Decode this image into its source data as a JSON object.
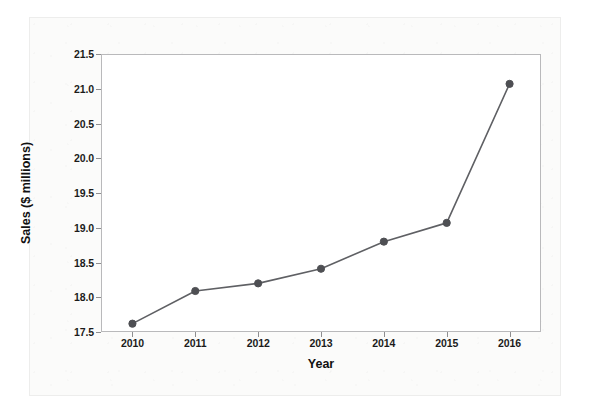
{
  "chart_data": {
    "type": "line",
    "title": "",
    "xlabel": "Year",
    "ylabel": "Sales ($ millions)",
    "categories": [
      "2010",
      "2011",
      "2012",
      "2013",
      "2014",
      "2015",
      "2016"
    ],
    "values": [
      17.62,
      18.09,
      18.2,
      18.41,
      18.8,
      19.07,
      21.07
    ],
    "series": [
      {
        "name": "Sales",
        "values": [
          17.62,
          18.09,
          18.2,
          18.41,
          18.8,
          19.07,
          21.07
        ]
      }
    ],
    "ylim": [
      17.5,
      21.5
    ],
    "y_ticks": [
      "17.5",
      "18.0",
      "18.5",
      "19.0",
      "19.5",
      "20.0",
      "20.5",
      "21.0",
      "21.5"
    ],
    "y_tick_values": [
      17.5,
      18.0,
      18.5,
      19.0,
      19.5,
      20.0,
      20.5,
      21.0,
      21.5
    ],
    "x_ticks": [
      "2010",
      "2011",
      "2012",
      "2013",
      "2014",
      "2015",
      "2016"
    ],
    "grid": false,
    "legend": "none",
    "marker": "circle",
    "line_color": "#5f6064",
    "marker_color": "#4e4f53",
    "frame_color": "#b9b9bb",
    "text_color": "#1b1b1b",
    "plot_background": "#ffffff",
    "page_background": "#fbfbfa"
  }
}
